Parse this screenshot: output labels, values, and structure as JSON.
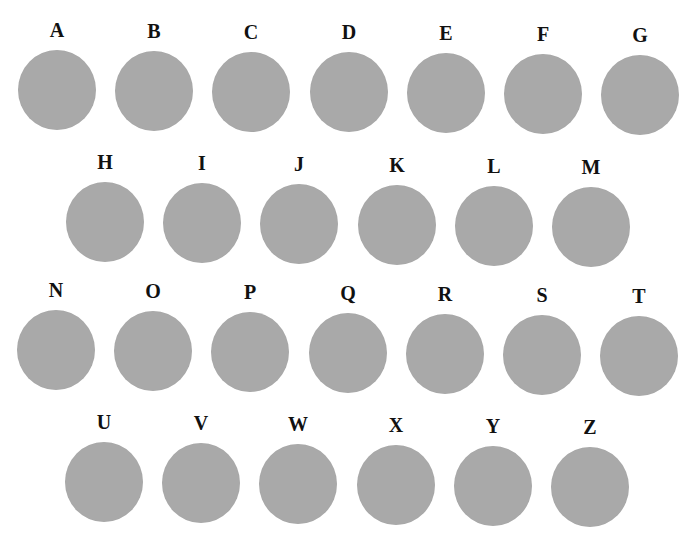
{
  "figure": {
    "disc_color": "#a9a9a9",
    "label_color": "#111111",
    "rows": [
      {
        "items": [
          {
            "label": "A",
            "x": 17,
            "y": 20
          },
          {
            "label": "B",
            "x": 114,
            "y": 21
          },
          {
            "label": "C",
            "x": 211,
            "y": 22
          },
          {
            "label": "D",
            "x": 309,
            "y": 22
          },
          {
            "label": "E",
            "x": 406,
            "y": 23
          },
          {
            "label": "F",
            "x": 503,
            "y": 24
          },
          {
            "label": "G",
            "x": 600,
            "y": 25
          }
        ]
      },
      {
        "items": [
          {
            "label": "H",
            "x": 65,
            "y": 152
          },
          {
            "label": "I",
            "x": 162,
            "y": 153
          },
          {
            "label": "J",
            "x": 259,
            "y": 154
          },
          {
            "label": "K",
            "x": 357,
            "y": 155
          },
          {
            "label": "L",
            "x": 454,
            "y": 156
          },
          {
            "label": "M",
            "x": 551,
            "y": 157
          }
        ]
      },
      {
        "items": [
          {
            "label": "N",
            "x": 16,
            "y": 280
          },
          {
            "label": "O",
            "x": 113,
            "y": 281
          },
          {
            "label": "P",
            "x": 210,
            "y": 282
          },
          {
            "label": "Q",
            "x": 308,
            "y": 283
          },
          {
            "label": "R",
            "x": 405,
            "y": 284
          },
          {
            "label": "S",
            "x": 502,
            "y": 285
          },
          {
            "label": "T",
            "x": 599,
            "y": 286
          }
        ]
      },
      {
        "items": [
          {
            "label": "U",
            "x": 64,
            "y": 412
          },
          {
            "label": "V",
            "x": 161,
            "y": 413
          },
          {
            "label": "W",
            "x": 258,
            "y": 414
          },
          {
            "label": "X",
            "x": 356,
            "y": 415
          },
          {
            "label": "Y",
            "x": 453,
            "y": 416
          },
          {
            "label": "Z",
            "x": 550,
            "y": 417
          }
        ]
      }
    ]
  }
}
